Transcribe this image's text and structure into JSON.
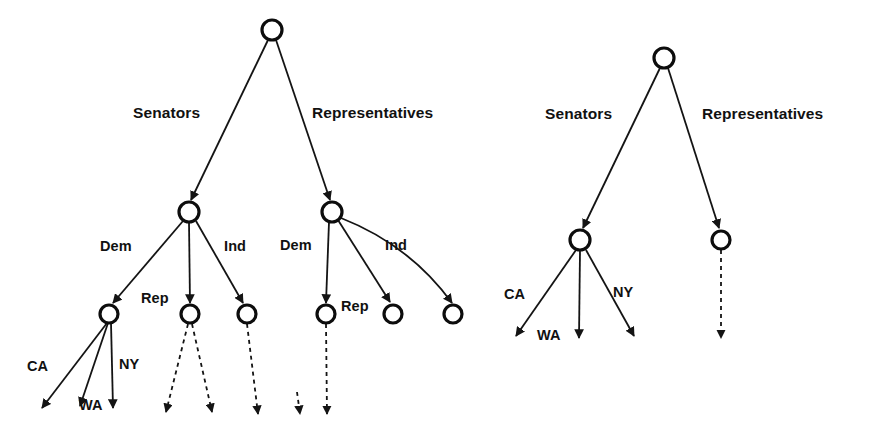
{
  "figure": {
    "kind": "tree-diagram",
    "background_color": "#ffffff",
    "stroke_color": "#141414",
    "node_fill": "#ffffff",
    "width": 875,
    "height": 442
  },
  "trees": [
    {
      "id": "left-tree",
      "root": {
        "cx": 272,
        "cy": 30,
        "r": 10
      },
      "level1": [
        {
          "id": "left-senators-node",
          "cx": 189,
          "cy": 212,
          "r": 10
        },
        {
          "id": "left-representatives-node",
          "cx": 332,
          "cy": 212,
          "r": 10
        }
      ],
      "level2": [
        {
          "id": "left-sen-dem-node",
          "cx": 109,
          "cy": 314,
          "r": 9
        },
        {
          "id": "left-sen-rep-node",
          "cx": 190,
          "cy": 314,
          "r": 9
        },
        {
          "id": "left-sen-ind-node",
          "cx": 247,
          "cy": 314,
          "r": 9
        },
        {
          "id": "left-rep-dem-node",
          "cx": 326,
          "cy": 314,
          "r": 9
        },
        {
          "id": "left-rep-rep-node",
          "cx": 393,
          "cy": 314,
          "r": 9
        },
        {
          "id": "left-rep-ind-node",
          "cx": 453,
          "cy": 314,
          "r": 9
        }
      ],
      "labels": {
        "branch_senators": "Senators",
        "branch_representatives": "Representatives",
        "party_dem_left": "Dem",
        "party_rep_left": "Rep",
        "party_ind_left": "Ind",
        "party_dem_right": "Dem",
        "party_rep_right": "Rep",
        "party_ind_right": "Ind",
        "state_ca": "CA",
        "state_wa": "WA",
        "state_ny": "NY"
      }
    },
    {
      "id": "right-tree",
      "root": {
        "cx": 664,
        "cy": 58,
        "r": 10
      },
      "level1": [
        {
          "id": "right-senators-node",
          "cx": 580,
          "cy": 240,
          "r": 10
        },
        {
          "id": "right-representatives-node",
          "cx": 721,
          "cy": 240,
          "r": 9
        }
      ],
      "labels": {
        "branch_senators": "Senators",
        "branch_representatives": "Representatives",
        "state_ca": "CA",
        "state_wa": "WA",
        "state_ny": "NY"
      }
    }
  ]
}
